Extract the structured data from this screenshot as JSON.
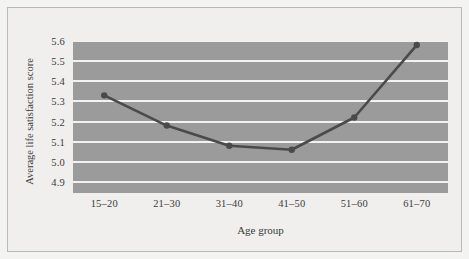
{
  "chart_data": {
    "type": "line",
    "title": "",
    "subtitle": "",
    "xlabel": "Age group",
    "ylabel": "Average life satisfaction score",
    "categories": [
      "15–20",
      "21–30",
      "31–40",
      "41–50",
      "51–60",
      "61–70"
    ],
    "values": [
      5.33,
      5.18,
      5.08,
      5.06,
      5.22,
      5.58
    ],
    "series": [
      {
        "name": "Average life satisfaction score",
        "values": [
          5.33,
          5.18,
          5.08,
          5.06,
          5.22,
          5.58
        ]
      }
    ],
    "ylim": [
      4.845,
      5.6
    ],
    "ytick_labels": [
      "5.6",
      "5.5",
      "5.4",
      "5.3",
      "5.2",
      "5.1",
      "5.0",
      "4.9"
    ],
    "ytick_values": [
      5.6,
      5.5,
      5.4,
      5.3,
      5.2,
      5.1,
      5.0,
      4.9
    ],
    "grid": true,
    "grid_axis": "y",
    "legend": false,
    "legend_position": "none",
    "markers": true,
    "colors": {
      "plot_background": "#9b9b9b",
      "figure_background": "#f0efee",
      "page_background": "#f3f3f2",
      "gridline": "#f2f2f0",
      "series_line": "#4a4a4a",
      "marker": "#4a4a4a",
      "text": "#3b3b3b",
      "frame_border": "#b9b9b7"
    }
  }
}
